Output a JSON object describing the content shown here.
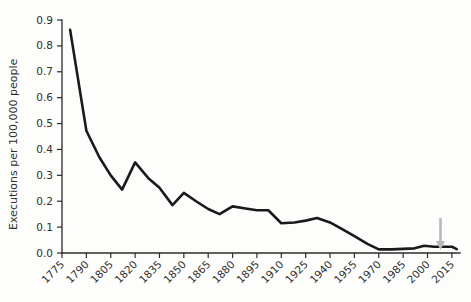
{
  "chart_data": {
    "type": "line",
    "title": "",
    "subtitle": "",
    "xlabel": "",
    "ylabel": "Executions per 100,000 people",
    "xlim": [
      1775,
      2020
    ],
    "ylim": [
      0.0,
      0.9
    ],
    "grid": false,
    "legend": null,
    "legend_position": "none",
    "x_tick_labels": [
      "1775",
      "1790",
      "1805",
      "1820",
      "1835",
      "1850",
      "1865",
      "1880",
      "1895",
      "1910",
      "1925",
      "1940",
      "1955",
      "1970",
      "1985",
      "2000",
      "2015"
    ],
    "x_tick_values": [
      1775,
      1790,
      1805,
      1820,
      1835,
      1850,
      1865,
      1880,
      1895,
      1910,
      1925,
      1940,
      1955,
      1970,
      1985,
      2000,
      2015
    ],
    "y_tick_labels": [
      "0.0",
      "0.1",
      "0.2",
      "0.3",
      "0.4",
      "0.5",
      "0.6",
      "0.7",
      "0.8",
      "0.9"
    ],
    "y_tick_values": [
      0.0,
      0.1,
      0.2,
      0.3,
      0.4,
      0.5,
      0.6,
      0.7,
      0.8,
      0.9
    ],
    "series": [
      {
        "name": "Executions per 100,000 people",
        "color": "#1a1a1a",
        "x": [
          1780,
          1790,
          1798,
          1805,
          1812,
          1820,
          1828,
          1835,
          1843,
          1850,
          1858,
          1865,
          1872,
          1880,
          1888,
          1895,
          1902,
          1910,
          1918,
          1925,
          1932,
          1940,
          1948,
          1955,
          1963,
          1970,
          1978,
          1985,
          1992,
          1998,
          2004,
          2010,
          2015,
          2018
        ],
        "y": [
          0.862,
          0.472,
          0.37,
          0.3,
          0.245,
          0.35,
          0.29,
          0.252,
          0.185,
          0.232,
          0.198,
          0.17,
          0.15,
          0.18,
          0.172,
          0.165,
          0.165,
          0.115,
          0.118,
          0.125,
          0.135,
          0.118,
          0.09,
          0.065,
          0.035,
          0.014,
          0.014,
          0.016,
          0.018,
          0.028,
          0.024,
          0.024,
          0.024,
          0.015
        ]
      }
    ],
    "annotations": [
      {
        "type": "arrow",
        "name": "downward-arrow-marker",
        "direction": "down",
        "x": 2008,
        "color": "#b9b9b9",
        "label": ""
      }
    ]
  },
  "axes": {
    "y_axis_name": "y-axis",
    "x_axis_name": "x-axis"
  }
}
